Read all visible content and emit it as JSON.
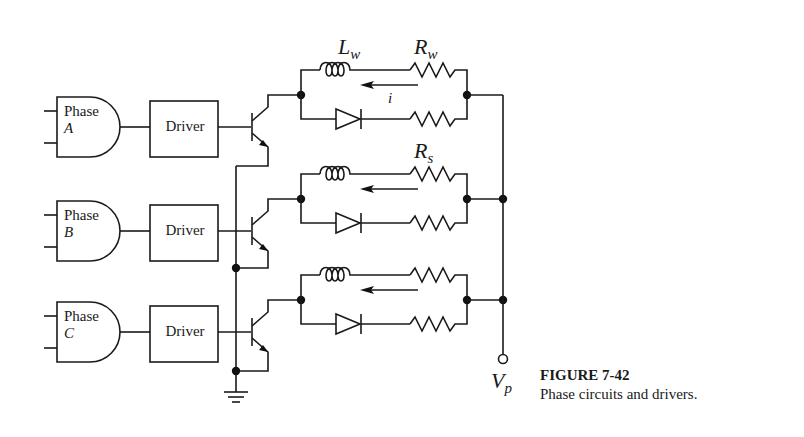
{
  "figure": {
    "number": "FIGURE 7-42",
    "caption": "Phase circuits and drivers."
  },
  "phases": [
    {
      "gate_label": "Phase",
      "phase_letter": "A",
      "driver_label": "Driver"
    },
    {
      "gate_label": "Phase",
      "phase_letter": "B",
      "driver_label": "Driver"
    },
    {
      "gate_label": "Phase",
      "phase_letter": "C",
      "driver_label": "Driver"
    }
  ],
  "components": {
    "winding_inductance": {
      "sym": "L",
      "sub": "w"
    },
    "winding_resistance": {
      "sym": "R",
      "sub": "w"
    },
    "suppression_resistance": {
      "sym": "R",
      "sub": "s"
    },
    "current": "i",
    "supply": {
      "sym": "V",
      "sub": "p"
    }
  }
}
